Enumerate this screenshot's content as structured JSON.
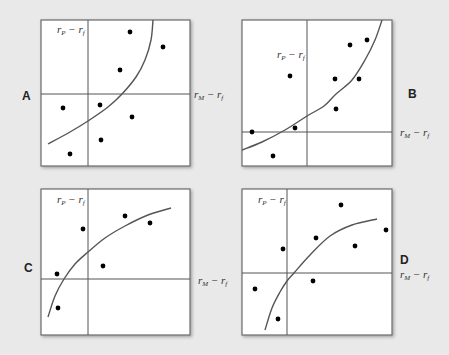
{
  "figure": {
    "background": "#e9e9e9",
    "panel_fill": "#ffffff",
    "axis_color": "#555555",
    "dot_color": "#000000"
  },
  "chart_data": [
    {
      "type": "scatter",
      "title": "A",
      "xlabel": "rM − rf",
      "ylabel": "rP − rf",
      "box": [
        41,
        20,
        190,
        166
      ],
      "origin": [
        88,
        94
      ],
      "points": [
        [
          130,
          32
        ],
        [
          163,
          47
        ],
        [
          120,
          70
        ],
        [
          63,
          108
        ],
        [
          100,
          105
        ],
        [
          132,
          117
        ],
        [
          101,
          140
        ],
        [
          70,
          154
        ]
      ],
      "fit_curve": [
        [
          48,
          144
        ],
        [
          70,
          132
        ],
        [
          88,
          121
        ],
        [
          108,
          107
        ],
        [
          122,
          94
        ],
        [
          136,
          77
        ],
        [
          145,
          60
        ],
        [
          151,
          40
        ],
        [
          153,
          20
        ]
      ],
      "label_pos": {
        "letter": [
          22,
          100
        ],
        "y_label": [
          57,
          33
        ],
        "x_label": [
          194,
          98
        ]
      }
    },
    {
      "type": "scatter",
      "title": "B",
      "xlabel": "rM − rf",
      "ylabel": "rP − rf",
      "box": [
        242,
        20,
        392,
        166
      ],
      "origin": [
        307,
        132
      ],
      "points": [
        [
          252,
          132
        ],
        [
          273,
          156
        ],
        [
          290,
          76
        ],
        [
          295,
          128
        ],
        [
          335,
          79
        ],
        [
          336,
          109
        ],
        [
          350,
          45
        ],
        [
          367,
          40
        ],
        [
          359,
          79
        ]
      ],
      "fit_curve": [
        [
          242,
          150
        ],
        [
          262,
          142
        ],
        [
          285,
          130
        ],
        [
          307,
          116
        ],
        [
          324,
          106
        ],
        [
          336,
          94
        ],
        [
          352,
          80
        ],
        [
          365,
          60
        ],
        [
          375,
          40
        ],
        [
          382,
          20
        ]
      ],
      "label_pos": {
        "letter": [
          408,
          98
        ],
        "y_label": [
          277,
          58
        ],
        "x_label": [
          400,
          136
        ]
      }
    },
    {
      "type": "scatter",
      "title": "C",
      "xlabel": "rM − rf",
      "ylabel": "rP − rf",
      "box": [
        41,
        189,
        190,
        335
      ],
      "origin": [
        88,
        279
      ],
      "points": [
        [
          57,
          274
        ],
        [
          83,
          229
        ],
        [
          58,
          308
        ],
        [
          103,
          266
        ],
        [
          125,
          216
        ],
        [
          150,
          223
        ]
      ],
      "fit_curve": [
        [
          48,
          317
        ],
        [
          55,
          296
        ],
        [
          64,
          279
        ],
        [
          75,
          264
        ],
        [
          88,
          252
        ],
        [
          105,
          238
        ],
        [
          125,
          226
        ],
        [
          148,
          215
        ],
        [
          171,
          208
        ]
      ],
      "label_pos": {
        "letter": [
          24,
          272
        ],
        "y_label": [
          57,
          203
        ],
        "x_label": [
          198,
          284
        ]
      }
    },
    {
      "type": "scatter",
      "title": "D",
      "xlabel": "rM − rf",
      "ylabel": "rP − rf",
      "box": [
        242,
        189,
        392,
        335
      ],
      "origin": [
        287,
        273
      ],
      "points": [
        [
          255,
          289
        ],
        [
          278,
          319
        ],
        [
          283,
          249
        ],
        [
          316,
          238
        ],
        [
          313,
          281
        ],
        [
          341,
          205
        ],
        [
          355,
          246
        ],
        [
          386,
          230
        ]
      ],
      "fit_curve": [
        [
          265,
          330
        ],
        [
          272,
          308
        ],
        [
          280,
          292
        ],
        [
          287,
          281
        ],
        [
          294,
          273
        ],
        [
          310,
          255
        ],
        [
          330,
          236
        ],
        [
          352,
          225
        ],
        [
          377,
          219
        ]
      ],
      "label_pos": {
        "letter": [
          400,
          264
        ],
        "y_label": [
          258,
          203
        ],
        "x_label": [
          400,
          278
        ]
      }
    }
  ],
  "panels": [
    {
      "letter": "A",
      "y_label": "r",
      "y_sub": "P",
      "x_label": "r",
      "x_sub": "M",
      "minus": " − ",
      "f_label": "r",
      "f_sub": "f"
    },
    {
      "letter": "B",
      "y_label": "r",
      "y_sub": "P",
      "x_label": "r",
      "x_sub": "M",
      "minus": " − ",
      "f_label": "r",
      "f_sub": "f"
    },
    {
      "letter": "C",
      "y_label": "r",
      "y_sub": "P",
      "x_label": "r",
      "x_sub": "M",
      "minus": " − ",
      "f_label": "r",
      "f_sub": "f"
    },
    {
      "letter": "D",
      "y_label": "r",
      "y_sub": "P",
      "x_label": "r",
      "x_sub": "M",
      "minus": " − ",
      "f_label": "r",
      "f_sub": "f"
    }
  ]
}
